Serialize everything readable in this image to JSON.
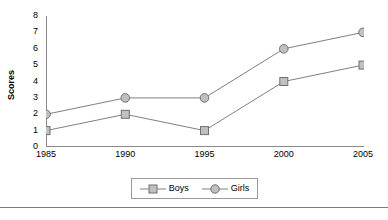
{
  "chart_data": {
    "type": "line",
    "title": "",
    "xlabel": "",
    "ylabel": "Scores",
    "categories": [
      "1985",
      "1990",
      "1995",
      "2000",
      "2005"
    ],
    "x": [
      1985,
      1990,
      1995,
      2000,
      2005
    ],
    "series": [
      {
        "name": "Boys",
        "marker": "square",
        "values": [
          1,
          2,
          1,
          4,
          5
        ]
      },
      {
        "name": "Girls",
        "marker": "circle",
        "values": [
          2,
          3,
          3,
          6,
          7
        ]
      }
    ],
    "ylim": [
      0,
      8
    ],
    "yticks": [
      0,
      1,
      2,
      3,
      4,
      5,
      6,
      7,
      8
    ],
    "ytick_labels": [
      "0",
      "1",
      "2",
      "3",
      "4",
      "5",
      "6",
      "7",
      "8"
    ],
    "xtick_labels": [
      "1985",
      "1990",
      "1995",
      "2000",
      "2005"
    ],
    "grid": false,
    "legend_position": "bottom-center",
    "colors": {
      "line": "#808080",
      "marker_fill": "#c0c0c0",
      "marker_stroke": "#707070",
      "axis": "#8a8a8a",
      "text": "#000000",
      "legend_border": "#9a9a9a",
      "rule": "#7d7d7d"
    }
  },
  "legend": {
    "items": [
      {
        "label": "Boys",
        "marker": "square"
      },
      {
        "label": "Girls",
        "marker": "circle"
      }
    ]
  },
  "axis": {
    "y_title": "Scores"
  }
}
